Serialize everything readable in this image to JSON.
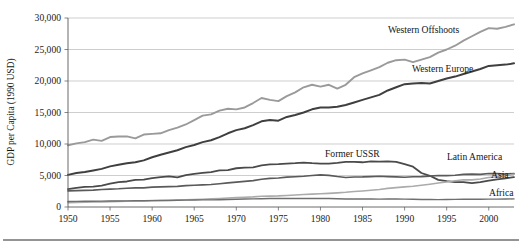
{
  "chart_data": {
    "type": "line",
    "title": "",
    "xlabel": "",
    "ylabel": "GDP per Capita (1990 USD)",
    "xlim": [
      1950,
      2003
    ],
    "ylim": [
      0,
      30000
    ],
    "grid": true,
    "legend_position": "inline-annotations",
    "x_ticks": [
      "1950",
      "1955",
      "1960",
      "1965",
      "1970",
      "1975",
      "1980",
      "1985",
      "1990",
      "1995",
      "2000"
    ],
    "x_tick_values": [
      1950,
      1955,
      1960,
      1965,
      1970,
      1975,
      1980,
      1985,
      1990,
      1995,
      2000
    ],
    "y_ticks": [
      "0",
      "5,000",
      "10,000",
      "15,000",
      "20,000",
      "25,000",
      "30,000"
    ],
    "y_tick_values": [
      0,
      5000,
      10000,
      15000,
      20000,
      25000,
      30000
    ],
    "x": [
      1950,
      1951,
      1952,
      1953,
      1954,
      1955,
      1956,
      1957,
      1958,
      1959,
      1960,
      1961,
      1962,
      1963,
      1964,
      1965,
      1966,
      1967,
      1968,
      1969,
      1970,
      1971,
      1972,
      1973,
      1974,
      1975,
      1976,
      1977,
      1978,
      1979,
      1980,
      1981,
      1982,
      1983,
      1984,
      1985,
      1986,
      1987,
      1988,
      1989,
      1990,
      1991,
      1992,
      1993,
      1994,
      1995,
      1996,
      1997,
      1998,
      1999,
      2000,
      2001,
      2002,
      2003
    ],
    "series": [
      {
        "name": "Western Offshoots",
        "color": "#9a9a9a",
        "width": 1.9,
        "values": [
          9800,
          10100,
          10300,
          10700,
          10500,
          11100,
          11200,
          11200,
          10900,
          11500,
          11600,
          11700,
          12200,
          12600,
          13100,
          13800,
          14500,
          14700,
          15300,
          15600,
          15500,
          15800,
          16500,
          17300,
          17000,
          16800,
          17600,
          18200,
          19000,
          19400,
          19100,
          19400,
          18800,
          19400,
          20600,
          21200,
          21700,
          22200,
          22900,
          23300,
          23400,
          23000,
          23400,
          23800,
          24500,
          25000,
          25600,
          26400,
          27100,
          27800,
          28400,
          28300,
          28600,
          29000
        ],
        "label_text": "Western Offshoots",
        "label_x": 388,
        "label_y": 33
      },
      {
        "name": "Western Europe",
        "color": "#3f3f3f",
        "width": 2.0,
        "values": [
          5100,
          5400,
          5550,
          5800,
          6050,
          6450,
          6700,
          6950,
          7100,
          7400,
          7900,
          8300,
          8650,
          9000,
          9500,
          9850,
          10300,
          10600,
          11100,
          11700,
          12200,
          12500,
          13000,
          13600,
          13800,
          13700,
          14300,
          14600,
          15000,
          15500,
          15800,
          15800,
          15900,
          16200,
          16600,
          17000,
          17400,
          17800,
          18500,
          19000,
          19500,
          19600,
          19700,
          19600,
          20000,
          20400,
          20700,
          21100,
          21500,
          21900,
          22400,
          22500,
          22600,
          22800
        ],
        "label_text": "Western Europe",
        "label_x": 412,
        "label_y": 72
      },
      {
        "name": "Former USSR",
        "color": "#4a4a4a",
        "width": 1.8,
        "values": [
          2840,
          3020,
          3200,
          3250,
          3400,
          3700,
          3950,
          4050,
          4300,
          4350,
          4600,
          4750,
          4850,
          4700,
          5050,
          5250,
          5400,
          5550,
          5800,
          5850,
          6150,
          6250,
          6300,
          6600,
          6750,
          6800,
          6900,
          6950,
          7050,
          6950,
          6900,
          6900,
          7000,
          7150,
          7150,
          7100,
          7250,
          7200,
          7250,
          7150,
          6800,
          6400,
          5400,
          4950,
          4300,
          4100,
          3950,
          3950,
          3800,
          3950,
          4200,
          4400,
          4550,
          4750
        ],
        "label_text": "Former USSR",
        "label_x": 325,
        "label_y": 157
      },
      {
        "name": "Latin America",
        "color": "#5a5a5a",
        "width": 1.7,
        "values": [
          2550,
          2600,
          2650,
          2680,
          2780,
          2850,
          2900,
          2980,
          3030,
          3050,
          3140,
          3200,
          3230,
          3280,
          3400,
          3450,
          3520,
          3570,
          3690,
          3820,
          3960,
          4080,
          4200,
          4400,
          4550,
          4600,
          4730,
          4800,
          4880,
          5000,
          5100,
          5030,
          4840,
          4680,
          4760,
          4770,
          4830,
          4880,
          4830,
          4790,
          4720,
          4800,
          4830,
          4900,
          5000,
          4970,
          5040,
          5190,
          5220,
          5180,
          5320,
          5300,
          5230,
          5300
        ],
        "label_text": "Latin America",
        "label_x": 447,
        "label_y": 160
      },
      {
        "name": "Asia",
        "color": "#ababab",
        "width": 1.6,
        "values": [
          700,
          730,
          760,
          800,
          820,
          860,
          890,
          910,
          950,
          980,
          1010,
          1030,
          1060,
          1100,
          1160,
          1200,
          1240,
          1290,
          1350,
          1420,
          1500,
          1540,
          1600,
          1700,
          1720,
          1760,
          1830,
          1900,
          1980,
          2050,
          2100,
          2170,
          2240,
          2330,
          2450,
          2540,
          2650,
          2780,
          2950,
          3080,
          3200,
          3300,
          3450,
          3620,
          3800,
          3980,
          4160,
          4320,
          4300,
          4450,
          4680,
          4800,
          4980,
          5200
        ],
        "label_text": "Asia",
        "label_x": 491,
        "label_y": 178
      },
      {
        "name": "Africa",
        "color": "#6f6f6f",
        "width": 1.4,
        "values": [
          880,
          890,
          905,
          920,
          935,
          950,
          960,
          975,
          985,
          990,
          1010,
          1020,
          1040,
          1060,
          1090,
          1110,
          1125,
          1135,
          1160,
          1200,
          1240,
          1260,
          1290,
          1320,
          1350,
          1340,
          1360,
          1360,
          1340,
          1350,
          1360,
          1340,
          1320,
          1280,
          1270,
          1280,
          1260,
          1250,
          1265,
          1265,
          1250,
          1230,
          1200,
          1180,
          1175,
          1190,
          1210,
          1220,
          1225,
          1230,
          1245,
          1255,
          1270,
          1290
        ],
        "label_text": "Africa",
        "label_x": 489,
        "label_y": 196
      }
    ]
  },
  "axis": {
    "y_title": "GDP per Capita (1990 USD)"
  }
}
